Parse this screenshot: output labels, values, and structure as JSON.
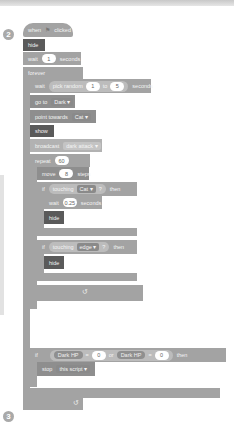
{
  "markers": {
    "step2": "2",
    "step3": "3"
  },
  "script": {
    "hat": {
      "text_before": "when",
      "icon": "green-flag-icon",
      "text_after": "clicked"
    },
    "hide1": "hide",
    "wait1": {
      "label": "wait",
      "value": "1",
      "unit": "seconds"
    },
    "forever": "forever",
    "wait_random": {
      "label": "wait",
      "op": "pick random",
      "from": "1",
      "to_label": "to",
      "to": "5",
      "unit": "seconds"
    },
    "goto": {
      "label": "go to",
      "target": "Dark ▾"
    },
    "point": {
      "label": "point towards",
      "target": "Cat ▾"
    },
    "show": "show",
    "broadcast": {
      "label": "broadcast",
      "message": "dark attack ▾"
    },
    "repeat": {
      "label": "repeat",
      "value": "60"
    },
    "move": {
      "label": "move",
      "value": "8",
      "unit": "steps"
    },
    "if1": {
      "label": "if",
      "cond": "touching",
      "target": "Cat ▾",
      "q": "?",
      "then": "then"
    },
    "wait2": {
      "label": "wait",
      "value": "0.25",
      "unit": "seconds"
    },
    "hide2": "hide",
    "if2": {
      "label": "if",
      "cond": "touching",
      "target": "edge ▾",
      "q": "?",
      "then": "then"
    },
    "hide3": "hide",
    "loop_arrow": "↺",
    "if3": {
      "label": "if",
      "var1": "Dark HP",
      "op1": "=",
      "val1": "0",
      "or": "or",
      "var2": "Dark HP",
      "op2": "=",
      "val2": "0",
      "then": "then"
    },
    "stop": {
      "label": "stop",
      "option": "this script ▾"
    },
    "loop_arrow2": "↺"
  }
}
